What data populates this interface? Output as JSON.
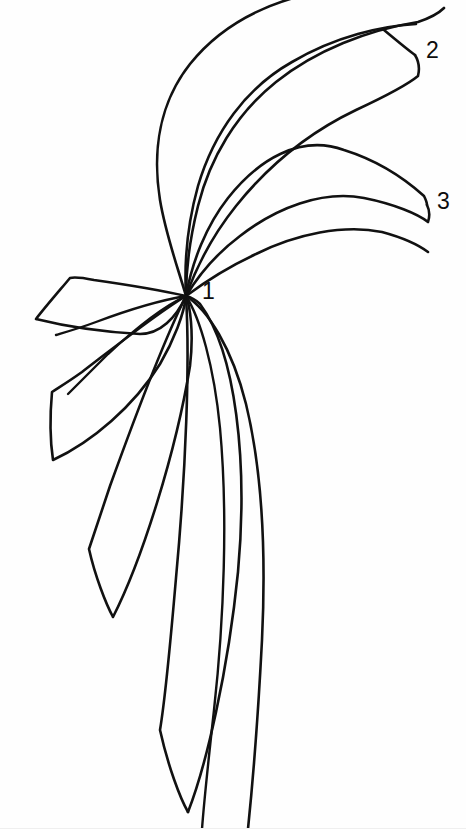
{
  "figure": {
    "background_color": "#fefefe",
    "stroke_color": "#111111",
    "width": 466,
    "height": 829,
    "center_point": {
      "x": 186,
      "y": 296
    },
    "labels": [
      {
        "id": "1",
        "text": "1",
        "x": 202,
        "y": 280,
        "refers_to": "center-convergence-point"
      },
      {
        "id": "2",
        "text": "2",
        "x": 426,
        "y": 39,
        "refers_to": "upper-petal-tip"
      },
      {
        "id": "3",
        "text": "3",
        "x": 437,
        "y": 190,
        "refers_to": "lower-upper-petal-tip"
      }
    ],
    "petals": [
      {
        "name": "petal-upper-outer",
        "stroke_width": 2.6,
        "tip": {
          "x": 415,
          "y": 55
        },
        "path": "M186,296 C168,214 176,118 232,58 C276,11 332,-8 386,2 C352,6 318,16 290,36 C256,60 232,96 216,140 C202,182 194,240 186,296 Z"
      },
      {
        "name": "petal-upper-second",
        "stroke_width": 2.6,
        "tip": {
          "x": 415,
          "y": 55
        },
        "path": "M186,296 C180,224 202,152 252,106 C306,56 372,36 418,54 C384,50 340,58 304,76 C262,98 230,134 212,178 C198,214 190,256 186,296 Z"
      },
      {
        "name": "petal-mid-third",
        "stroke_width": 2.6,
        "tip": {
          "x": 427,
          "y": 205
        },
        "path": "M186,296 C192,240 222,190 268,160 C322,126 388,128 428,160 C394,146 352,148 318,162 C276,180 242,214 218,252 C202,278 192,290 186,296 Z"
      },
      {
        "name": "petal-mid-fourth",
        "stroke_width": 2.6,
        "tip": {
          "x": 427,
          "y": 205
        },
        "path": "M186,296 C198,262 226,230 264,210 C320,180 388,180 426,206 C390,194 348,198 314,214 C274,232 240,262 216,286 C202,300 192,300 186,296 Z"
      },
      {
        "name": "petal-left-upper",
        "stroke_width": 2.6,
        "tip": {
          "x": 35,
          "y": 320
        },
        "corner": {
          "x": 70,
          "y": 278
        },
        "path": "M186,296 C150,286 110,280 70,278 C56,290 44,306 35,320 C62,326 110,330 146,330 C166,328 180,312 186,296 Z"
      },
      {
        "name": "petal-left-second",
        "stroke_width": 2.6,
        "tip": {
          "x": 53,
          "y": 460
        },
        "corner": {
          "x": 52,
          "y": 392
        },
        "path": "M186,296 C150,320 102,354 52,392 C50,418 50,442 53,460 C92,440 140,400 170,348 C180,328 186,308 186,296 Z"
      },
      {
        "name": "petal-left-third",
        "stroke_width": 2.6,
        "tip": {
          "x": 113,
          "y": 617
        },
        "corner": {
          "x": 89,
          "y": 549
        },
        "path": "M186,296 C162,348 126,454 89,549 C96,580 106,604 113,617 C140,564 174,452 188,356 C190,326 188,306 186,296 Z"
      },
      {
        "name": "petal-lower-long",
        "stroke_width": 2.6,
        "tip": {
          "x": 188,
          "y": 812
        },
        "corner": {
          "x": 160,
          "y": 730
        },
        "path": "M186,296 C192,388 180,572 160,730 C170,772 182,800 188,812 C212,752 240,600 246,452 C248,368 224,314 186,296 Z"
      },
      {
        "name": "petal-lower-right",
        "stroke_width": 2.6,
        "tip": {
          "x": 246,
          "y": 829
        },
        "path": "M186,296 C222,322 256,400 264,500 C270,610 256,740 246,829"
      }
    ]
  }
}
